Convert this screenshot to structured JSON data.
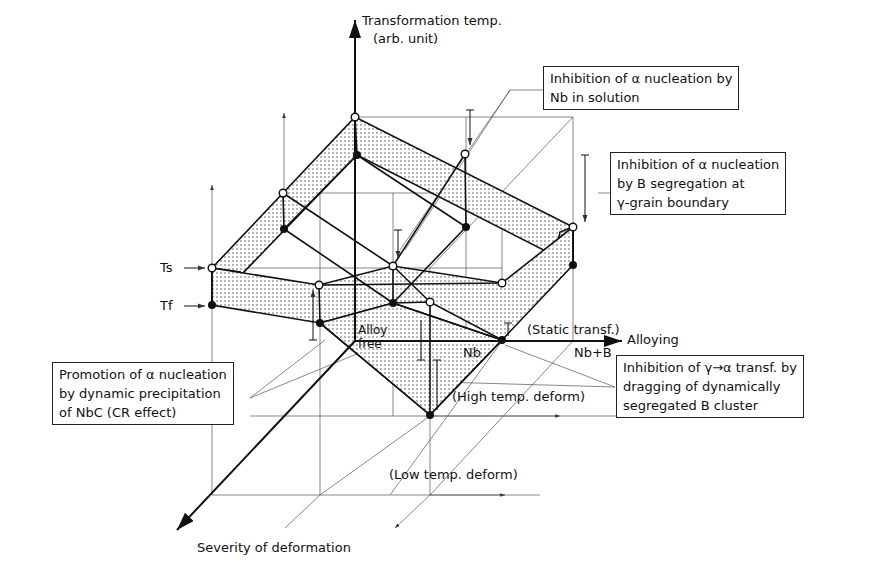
{
  "axes": {
    "vertical": {
      "label_line1": "Transformation temp.",
      "label_line2": "(arb. unit)"
    },
    "horizontal": {
      "label": "Alloying"
    },
    "depth": {
      "label": "Severity of deformation"
    }
  },
  "temperature_markers": {
    "start": "Ts",
    "finish": "Tf"
  },
  "alloying_levels": {
    "alloy_free_line1": "Alloy",
    "alloy_free_line2": "free",
    "nb": "Nb",
    "nb_b": "Nb+B"
  },
  "deformation_levels": {
    "static": "(Static transf.)",
    "high_temp": "(High temp. deform)",
    "low_temp": "(Low temp. deform)"
  },
  "annotations": {
    "nb_solution": {
      "line1": "Inhibition of α  nucleation by",
      "line2": "Nb in solution"
    },
    "b_segregation": {
      "line1": "Inhibition of α  nucleation",
      "line2": "by  B segregation at",
      "line3": "γ-grain boundary"
    },
    "nbc_precipitation": {
      "line1": "Promotion of α nucleation",
      "line2": "by dynamic precipitation",
      "line3": "of  NbC  (CR effect)"
    },
    "b_cluster": {
      "line1": "Inhibition of γ→α transf. by",
      "line2": "dragging of dynamically",
      "line3": "segregated  B  cluster"
    }
  },
  "legend": {
    "open_circle": "Ts (transformation start)",
    "filled_circle": "Tf (transformation finish)"
  },
  "colors": {
    "line": "#111111",
    "guide": "#555555",
    "stipple": "#333333",
    "background": "#ffffff"
  }
}
